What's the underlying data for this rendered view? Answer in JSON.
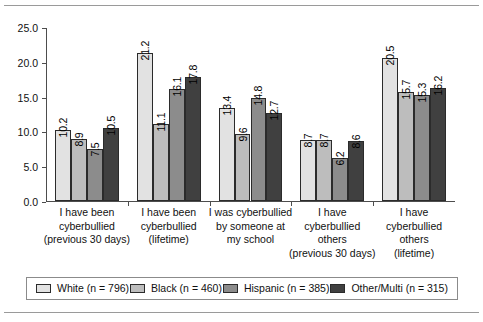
{
  "figure": {
    "top_rule": "horizontal-rule",
    "bottom_rule": "horizontal-rule"
  },
  "chart_data": {
    "type": "bar",
    "title": "",
    "xlabel": "",
    "ylabel": "",
    "ylim": [
      0,
      25
    ],
    "ytick_labels": [
      "25.0",
      "20.0",
      "15.0",
      "10.0",
      "5.0",
      "0.0"
    ],
    "ytick_values": [
      25.0,
      20.0,
      15.0,
      10.0,
      5.0,
      0.0
    ],
    "grid": false,
    "legend_position": "bottom",
    "categories": [
      "I have been cyberbullied (previous 30 days)",
      "I have been cyberbullied (lifetime)",
      "I was cyberbullied by someone at my school",
      "I have cyberbullied others (previous 30 days)",
      "I have cyberbullied others (lifetime)"
    ],
    "category_lines": [
      [
        "I have been",
        "cyberbullied",
        "(previous 30 days)"
      ],
      [
        "I have been",
        "cyberbullied",
        "(lifetime)"
      ],
      [
        "I was cyberbullied",
        "by someone at",
        "my school"
      ],
      [
        "I have",
        "cyberbullied",
        "others",
        "(previous 30 days)"
      ],
      [
        "I have",
        "cyberbullied",
        "others",
        "(lifetime)"
      ]
    ],
    "series": [
      {
        "name": "White (n = 796)",
        "color": "#e2e2e2",
        "values": [
          10.2,
          21.2,
          13.4,
          8.7,
          20.5
        ],
        "labels": [
          "10.2",
          "21.2",
          "13.4",
          "8.7",
          "20.5"
        ]
      },
      {
        "name": "Black (n = 460)",
        "color": "#bdbdbd",
        "values": [
          8.9,
          11.1,
          9.6,
          8.7,
          15.7
        ],
        "labels": [
          "8.9",
          "11.1",
          "9.6",
          "8.7",
          "15.7"
        ]
      },
      {
        "name": "Hispanic (n = 385)",
        "color": "#8c8c8c",
        "values": [
          7.5,
          16.1,
          14.8,
          6.2,
          15.3
        ],
        "labels": [
          "7.5",
          "16.1",
          "14.8",
          "6.2",
          "15.3"
        ]
      },
      {
        "name": "Other/Multi (n = 315)",
        "color": "#404040",
        "values": [
          10.5,
          17.8,
          12.7,
          8.6,
          16.2
        ],
        "labels": [
          "10.5",
          "17.8",
          "12.7",
          "8.6",
          "16.2"
        ]
      }
    ]
  },
  "legend": {
    "items": [
      {
        "label": "White (n = 796)"
      },
      {
        "label": "Black (n = 460)"
      },
      {
        "label": "Hispanic (n = 385)"
      },
      {
        "label": "Other/Multi (n = 315)"
      }
    ]
  }
}
